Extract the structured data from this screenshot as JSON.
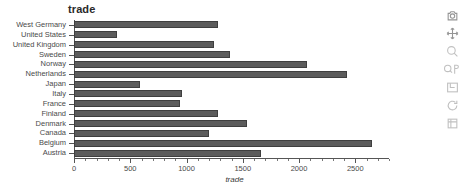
{
  "chart_data": {
    "type": "bar",
    "orientation": "horizontal",
    "title": "trade",
    "xlabel": "trade",
    "ylabel": "",
    "categories": [
      "West Germany",
      "United States",
      "United Kingdom",
      "Sweden",
      "Norway",
      "Netherlands",
      "Japan",
      "Italy",
      "France",
      "Finland",
      "Denmark",
      "Canada",
      "Belgium",
      "Austria"
    ],
    "values": [
      1280,
      380,
      1240,
      1390,
      2070,
      2430,
      590,
      960,
      945,
      1280,
      1540,
      1200,
      2650,
      1660
    ],
    "xlim": [
      0,
      2800
    ],
    "xticks": [
      0,
      500,
      1000,
      1500,
      2000,
      2500
    ],
    "xticklabels": [
      "0",
      "500",
      "1000",
      "1500",
      "2000",
      "2500"
    ],
    "grid": false,
    "legend": null,
    "bar_color": "#5c5c5c",
    "bar_edge_color": "#3f3f3f"
  },
  "modebar": {
    "buttons": [
      {
        "name": "download-plot-icon",
        "label": "Download plot as a png"
      },
      {
        "name": "pan-icon",
        "label": "Pan"
      },
      {
        "name": "zoom-icon",
        "label": "Zoom"
      },
      {
        "name": "zoom-in-out-icon",
        "label": "Zoom in / Zoom out"
      },
      {
        "name": "autoscale-icon",
        "label": "Autoscale"
      },
      {
        "name": "reset-axes-icon",
        "label": "Reset axes"
      },
      {
        "name": "toggle-spike-lines-icon",
        "label": "Toggle spike lines"
      }
    ]
  }
}
